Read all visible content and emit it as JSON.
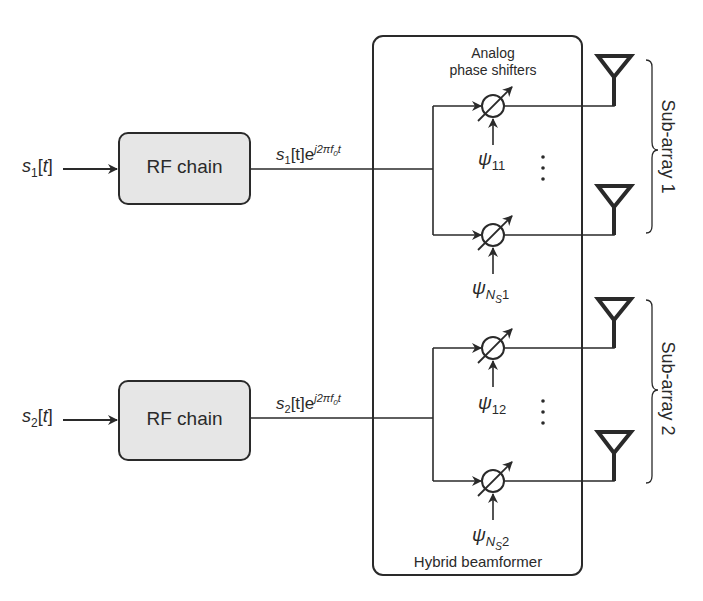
{
  "diagram": {
    "type": "hybrid beamforming block diagram",
    "colors": {
      "line": "#2a2a2a",
      "rf_fill": "#e6e6e6",
      "background": "#ffffff"
    },
    "inputs": [
      {
        "symbol": "s",
        "index": "1",
        "arg": "[t]"
      },
      {
        "symbol": "s",
        "index": "2",
        "arg": "[t]"
      }
    ],
    "rf_chains": [
      {
        "label": "RF chain"
      },
      {
        "label": "RF chain"
      }
    ],
    "rf_outputs": [
      {
        "symbol": "s",
        "index": "1",
        "arg": "[t]e",
        "exponent": "j2πf",
        "exp_sub": "0",
        "exp_tail": "t"
      },
      {
        "symbol": "s",
        "index": "2",
        "arg": "[t]e",
        "exponent": "j2πf",
        "exp_sub": "0",
        "exp_tail": "t"
      }
    ],
    "beamformer": {
      "title_line1": "Analog",
      "title_line2": "phase shifters",
      "footer": "Hybrid beamformer"
    },
    "phase_shifters": [
      {
        "psi": "ψ",
        "sub": "11"
      },
      {
        "psi": "ψ",
        "sub_ns": "N",
        "sub_ns_sub": "S",
        "sub_tail": "1"
      },
      {
        "psi": "ψ",
        "sub": "12"
      },
      {
        "psi": "ψ",
        "sub_ns": "N",
        "sub_ns_sub": "S",
        "sub_tail": "2"
      }
    ],
    "ellipsis": "⋮",
    "sub_arrays": [
      {
        "label": "Sub-array 1"
      },
      {
        "label": "Sub-array 2"
      }
    ]
  }
}
